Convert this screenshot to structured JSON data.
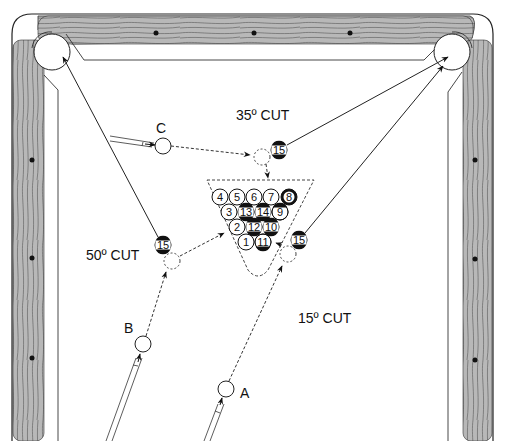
{
  "diagram": {
    "colors": {
      "rail": "#b8b8b8",
      "grain": "#555555",
      "diamond": "#111111",
      "line": "#222222",
      "felt": "#ffffff"
    },
    "labels": {
      "cut_35": "35º CUT",
      "cut_50": "50º CUT",
      "cut_15": "15º CUT",
      "cue_a": "A",
      "cue_b": "B",
      "cue_c": "C"
    },
    "rack": {
      "rows": [
        [
          "4",
          "5",
          "6",
          "7",
          "8"
        ],
        [
          "3",
          "13",
          "14",
          "9"
        ],
        [
          "2",
          "12",
          "10"
        ],
        [
          "1",
          "11"
        ]
      ],
      "striped": [
        "13",
        "14",
        "12",
        "10",
        "11",
        "9",
        "15"
      ],
      "solid_dark": [
        "8"
      ]
    },
    "object_ball": "15",
    "shots": [
      {
        "id": "C",
        "cut": "35º CUT",
        "target_pocket": "top-right"
      },
      {
        "id": "B",
        "cut": "50º CUT",
        "target_pocket": "top-left"
      },
      {
        "id": "A",
        "cut": "15º CUT",
        "target_pocket": "top-right"
      }
    ]
  }
}
